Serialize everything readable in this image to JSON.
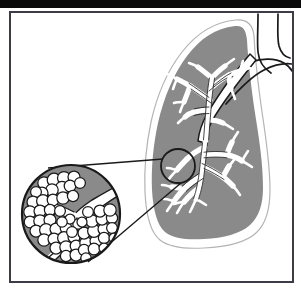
{
  "figure": {
    "caption": "",
    "width": 301,
    "height": 294,
    "background_color": "#ffffff",
    "top_band_color": "#0a0a0a",
    "frame": {
      "name": "figure-border",
      "x": 9,
      "y": 11,
      "width": 284,
      "height": 271,
      "stroke_color": "#3c3c46",
      "stroke_width": 2,
      "fill_color": "#ffffff"
    },
    "palette": {
      "tissue_gray": "#8a8a8a",
      "airway_white": "#ffffff",
      "outline_black": "#1a1a1a",
      "lung_edge_gray": "#9a9a9a",
      "frame_gray": "#3c3c46"
    },
    "parts": [
      {
        "name": "lung",
        "label": "Lung (right lung, coronal view)",
        "fill": "#8a8a8a",
        "halo_fill": "#ffffff",
        "edge_stroke": "#9a9a9a"
      },
      {
        "name": "trachea",
        "label": "Trachea",
        "stroke": "#1a1a1a",
        "fill": "#ffffff"
      },
      {
        "name": "contralateral-bronchus",
        "label": "Contralateral main bronchus",
        "stroke": "#1a1a1a"
      },
      {
        "name": "bronchial-tree",
        "label": "Bronchial tree",
        "fill": "#ffffff",
        "stroke": "#1a1a1a"
      },
      {
        "name": "callout-circle-small",
        "label": "Region of interest marker",
        "cx": 178,
        "cy": 166,
        "r": 17,
        "stroke": "#1a1a1a"
      },
      {
        "name": "callout-cone",
        "label": "Magnification leader lines",
        "stroke": "#1a1a1a"
      },
      {
        "name": "magnifier-circle",
        "label": "Magnified view of alveolar sac cluster",
        "cx": 71,
        "cy": 214,
        "r": 50,
        "fill": "#8a8a8a",
        "stroke": "#1a1a1a"
      },
      {
        "name": "bronchiole",
        "label": "Terminal bronchiole",
        "fill": "#ffffff",
        "stroke": "#1a1a1a"
      },
      {
        "name": "alveoli",
        "label": "Alveoli",
        "fill": "#ffffff",
        "stroke": "#1a1a1a",
        "count": 58
      }
    ],
    "alveoli_positions": [
      [
        44,
        183,
        6.2
      ],
      [
        54,
        180,
        6.8
      ],
      [
        64,
        178,
        6.5
      ],
      [
        74,
        177,
        6.0
      ],
      [
        62,
        188,
        6.6
      ],
      [
        52,
        190,
        6.2
      ],
      [
        42,
        193,
        6.0
      ],
      [
        36,
        192,
        5.4
      ],
      [
        70,
        186,
        5.8
      ],
      [
        80,
        183,
        5.4
      ],
      [
        33,
        202,
        6.0
      ],
      [
        43,
        201,
        6.4
      ],
      [
        53,
        200,
        5.8
      ],
      [
        63,
        198,
        6.2
      ],
      [
        73,
        196,
        5.6
      ],
      [
        30,
        212,
        6.2
      ],
      [
        40,
        211,
        6.0
      ],
      [
        50,
        210,
        5.6
      ],
      [
        30,
        222,
        5.8
      ],
      [
        40,
        221,
        6.2
      ],
      [
        50,
        220,
        6.0
      ],
      [
        60,
        211,
        5.4
      ],
      [
        36,
        231,
        6.0
      ],
      [
        46,
        230,
        6.4
      ],
      [
        56,
        229,
        6.0
      ],
      [
        66,
        228,
        5.8
      ],
      [
        44,
        240,
        6.2
      ],
      [
        54,
        239,
        6.0
      ],
      [
        64,
        238,
        6.4
      ],
      [
        74,
        237,
        6.0
      ],
      [
        56,
        248,
        6.0
      ],
      [
        66,
        247,
        6.2
      ],
      [
        76,
        246,
        5.8
      ],
      [
        66,
        256,
        5.6
      ],
      [
        76,
        255,
        6.0
      ],
      [
        86,
        243,
        6.2
      ],
      [
        96,
        241,
        6.0
      ],
      [
        84,
        233,
        6.0
      ],
      [
        94,
        231,
        6.4
      ],
      [
        104,
        229,
        6.0
      ],
      [
        92,
        221,
        6.2
      ],
      [
        102,
        219,
        6.0
      ],
      [
        112,
        218,
        5.6
      ],
      [
        100,
        211,
        6.0
      ],
      [
        110,
        210,
        6.2
      ],
      [
        88,
        212,
        5.4
      ],
      [
        84,
        250,
        5.6
      ],
      [
        94,
        249,
        5.8
      ],
      [
        104,
        238,
        5.6
      ],
      [
        112,
        228,
        5.4
      ],
      [
        78,
        224,
        5.2
      ],
      [
        70,
        219,
        5.0
      ],
      [
        62,
        222,
        5.2
      ],
      [
        72,
        232,
        5.4
      ],
      [
        82,
        222,
        5.0
      ],
      [
        86,
        258,
        5.2
      ],
      [
        104,
        248,
        5.0
      ],
      [
        114,
        238,
        5.0
      ]
    ]
  }
}
